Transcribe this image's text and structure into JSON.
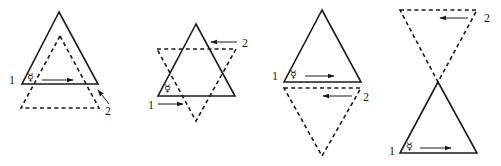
{
  "figure": {
    "panels": [
      {
        "id": "panel-1",
        "arrangement": "dashed upright triangle offset below solid upright triangle",
        "label_1": "1",
        "label_2": "2",
        "symbol": "☿",
        "arrow_1_direction": "right",
        "arrow_2_direction": "up-left"
      },
      {
        "id": "panel-2",
        "arrangement": "solid upright triangle overlapping dashed inverted triangle (star)",
        "label_1": "1",
        "label_2": "2",
        "symbol": "☿",
        "arrow_1_direction": "right",
        "arrow_2_direction": "left"
      },
      {
        "id": "panel-3",
        "arrangement": "solid upright triangle above dashed inverted triangle, bases adjacent",
        "label_1": "1",
        "label_2": "2",
        "symbol": "☿",
        "arrow_1_direction": "right",
        "arrow_2_direction": "left"
      },
      {
        "id": "panel-4",
        "arrangement": "dashed inverted triangle above solid upright triangle, apexes touching",
        "label_1": "1",
        "label_2": "2",
        "symbol": "☿",
        "arrow_1_direction": "right",
        "arrow_2_direction": "left"
      }
    ]
  }
}
